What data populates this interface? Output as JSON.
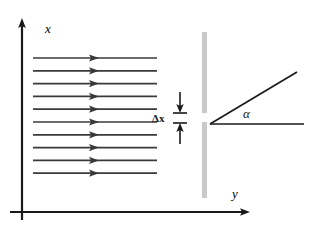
{
  "figure": {
    "background_color": "#ffffff",
    "width": 311,
    "height": 234
  },
  "axes": {
    "vertical": {
      "label": "x",
      "color": "#1a1a1a",
      "x": 22,
      "y_top": 20,
      "y_bottom": 220,
      "label_x": 45,
      "label_y": 33
    },
    "horizontal": {
      "label": "y",
      "color": "#1a1a1a",
      "y": 212,
      "x_left": 10,
      "x_right": 250,
      "label_x": 232,
      "label_y": 198
    }
  },
  "wavefront_arrows": {
    "name": "incoming-plane-wave-arrows",
    "count": 10,
    "color": "#3a3a3a",
    "x_start": 33,
    "x_end": 157,
    "arrowhead_x": 93,
    "y_first": 58,
    "y_spacing": 12.8
  },
  "barrier": {
    "name": "slit-barrier",
    "color": "#c9c9c9",
    "x": 202,
    "width": 5,
    "top_segment": {
      "y_start": 32,
      "y_end": 113
    },
    "bottom_segment": {
      "y_start": 122,
      "y_end": 198
    },
    "gap": {
      "y_start": 113,
      "y_end": 122
    }
  },
  "slit_width_marker": {
    "name": "delta-x-dimension",
    "label": "Δx",
    "label_x": 152,
    "label_y": 122,
    "line_x": 180,
    "upper_arrow": {
      "y_start": 92,
      "y_end": 112
    },
    "lower_arrow": {
      "y_start": 143,
      "y_end": 123
    },
    "tick_half_width": 7,
    "color": "#1a1a1a"
  },
  "diffraction_angle": {
    "name": "alpha-angle",
    "label": "α",
    "label_x": 243,
    "label_y": 118,
    "vertex_x": 210,
    "vertex_y": 124,
    "ray_horizontal_end_x": 304,
    "ray_diagonal_end_x": 297,
    "ray_diagonal_end_y": 72,
    "color": "#1a1a1a"
  },
  "colors": {
    "ink": "#1a1a1a",
    "ray": "#3a3a3a",
    "barrier": "#c9c9c9",
    "background": "#ffffff"
  }
}
